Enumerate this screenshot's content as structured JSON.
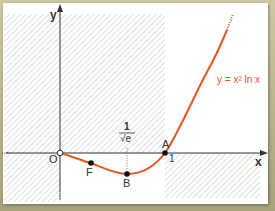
{
  "figure": {
    "function_label": "y = x² ln x",
    "axis_x_label": "x",
    "axis_y_label": "y",
    "origin_label": "O",
    "points": [
      {
        "name": "A",
        "label": "A",
        "x_value": "1"
      },
      {
        "name": "B",
        "label": "B",
        "x_value_num": "1",
        "x_value_den": "√e"
      },
      {
        "name": "F",
        "label": "F"
      }
    ],
    "tick_one_label": "1",
    "colors": {
      "curve": "#e0571f",
      "label": "#e0571f",
      "hatch": "#c9c9c9",
      "axis": "#333333",
      "frame": "#b7b08a"
    }
  }
}
